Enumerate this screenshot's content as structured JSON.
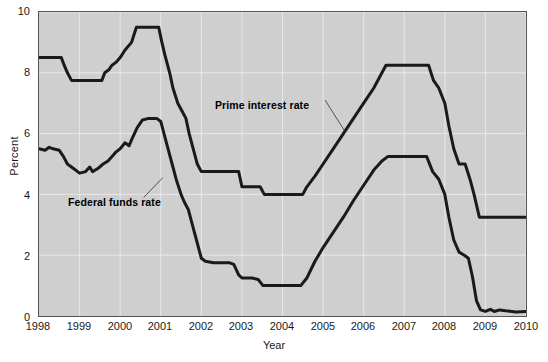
{
  "chart_data": {
    "type": "line",
    "title": "",
    "xlabel": "Year",
    "ylabel": "Percent",
    "xlim": [
      1998,
      2010
    ],
    "ylim": [
      0,
      10
    ],
    "ytick_labels": [
      "0",
      "2",
      "4",
      "6",
      "8",
      "10"
    ],
    "ytick_values": [
      0,
      2,
      4,
      6,
      8,
      10
    ],
    "xtick_labels": [
      "1998",
      "1999",
      "2000",
      "2001",
      "2002",
      "2003",
      "2004",
      "2005",
      "2006",
      "2007",
      "2008",
      "2009",
      "2010"
    ],
    "xtick_values": [
      1998,
      1999,
      2000,
      2001,
      2002,
      2003,
      2004,
      2005,
      2006,
      2007,
      2008,
      2009,
      2010
    ],
    "grid": true,
    "grid_color": "#e8e8e8",
    "plot_background": "#cfcfcf",
    "line_color": "#1a1a1a",
    "legend_position": "inline-annotation",
    "series": [
      {
        "name": "Prime interest rate",
        "annotation": "Prime interest rate",
        "points": [
          [
            1998.0,
            8.5
          ],
          [
            1998.55,
            8.5
          ],
          [
            1998.62,
            8.25
          ],
          [
            1998.7,
            8.0
          ],
          [
            1998.8,
            7.75
          ],
          [
            1999.55,
            7.75
          ],
          [
            1999.62,
            8.0
          ],
          [
            1999.72,
            8.1
          ],
          [
            1999.8,
            8.25
          ],
          [
            1999.9,
            8.35
          ],
          [
            2000.0,
            8.5
          ],
          [
            2000.12,
            8.75
          ],
          [
            2000.28,
            9.0
          ],
          [
            2000.4,
            9.5
          ],
          [
            2000.95,
            9.5
          ],
          [
            2001.02,
            9.05
          ],
          [
            2001.1,
            8.6
          ],
          [
            2001.22,
            8.0
          ],
          [
            2001.3,
            7.5
          ],
          [
            2001.42,
            7.0
          ],
          [
            2001.52,
            6.75
          ],
          [
            2001.62,
            6.5
          ],
          [
            2001.7,
            6.0
          ],
          [
            2001.8,
            5.5
          ],
          [
            2001.9,
            5.0
          ],
          [
            2002.0,
            4.75
          ],
          [
            2002.6,
            4.75
          ],
          [
            2002.92,
            4.75
          ],
          [
            2003.0,
            4.25
          ],
          [
            2003.45,
            4.25
          ],
          [
            2003.55,
            4.0
          ],
          [
            2004.5,
            4.0
          ],
          [
            2004.6,
            4.25
          ],
          [
            2004.8,
            4.6
          ],
          [
            2005.0,
            5.0
          ],
          [
            2005.25,
            5.5
          ],
          [
            2005.5,
            6.0
          ],
          [
            2005.75,
            6.5
          ],
          [
            2006.0,
            7.0
          ],
          [
            2006.25,
            7.5
          ],
          [
            2006.45,
            8.0
          ],
          [
            2006.55,
            8.25
          ],
          [
            2007.6,
            8.25
          ],
          [
            2007.72,
            7.75
          ],
          [
            2007.85,
            7.5
          ],
          [
            2008.0,
            7.0
          ],
          [
            2008.1,
            6.25
          ],
          [
            2008.22,
            5.5
          ],
          [
            2008.35,
            5.0
          ],
          [
            2008.5,
            5.0
          ],
          [
            2008.62,
            4.5
          ],
          [
            2008.72,
            4.0
          ],
          [
            2008.85,
            3.25
          ],
          [
            2009.0,
            3.25
          ],
          [
            2010.0,
            3.25
          ]
        ]
      },
      {
        "name": "Federal funds rate",
        "annotation": "Federal funds rate",
        "points": [
          [
            1998.0,
            5.5
          ],
          [
            1998.15,
            5.45
          ],
          [
            1998.25,
            5.55
          ],
          [
            1998.35,
            5.5
          ],
          [
            1998.5,
            5.45
          ],
          [
            1998.6,
            5.25
          ],
          [
            1998.7,
            5.0
          ],
          [
            1998.85,
            4.85
          ],
          [
            1999.0,
            4.7
          ],
          [
            1999.15,
            4.75
          ],
          [
            1999.25,
            4.9
          ],
          [
            1999.32,
            4.75
          ],
          [
            1999.45,
            4.85
          ],
          [
            1999.58,
            5.0
          ],
          [
            1999.7,
            5.1
          ],
          [
            1999.8,
            5.25
          ],
          [
            1999.9,
            5.4
          ],
          [
            2000.0,
            5.5
          ],
          [
            2000.12,
            5.7
          ],
          [
            2000.22,
            5.6
          ],
          [
            2000.3,
            5.85
          ],
          [
            2000.42,
            6.2
          ],
          [
            2000.55,
            6.45
          ],
          [
            2000.7,
            6.5
          ],
          [
            2000.9,
            6.5
          ],
          [
            2001.0,
            6.4
          ],
          [
            2001.08,
            6.0
          ],
          [
            2001.18,
            5.5
          ],
          [
            2001.28,
            5.0
          ],
          [
            2001.38,
            4.5
          ],
          [
            2001.5,
            4.0
          ],
          [
            2001.58,
            3.75
          ],
          [
            2001.68,
            3.5
          ],
          [
            2001.78,
            3.0
          ],
          [
            2001.88,
            2.5
          ],
          [
            2002.0,
            1.9
          ],
          [
            2002.1,
            1.8
          ],
          [
            2002.3,
            1.75
          ],
          [
            2002.7,
            1.75
          ],
          [
            2002.8,
            1.7
          ],
          [
            2002.92,
            1.35
          ],
          [
            2003.0,
            1.25
          ],
          [
            2003.25,
            1.25
          ],
          [
            2003.4,
            1.2
          ],
          [
            2003.52,
            1.0
          ],
          [
            2004.45,
            1.0
          ],
          [
            2004.6,
            1.25
          ],
          [
            2004.8,
            1.8
          ],
          [
            2005.0,
            2.25
          ],
          [
            2005.25,
            2.75
          ],
          [
            2005.5,
            3.25
          ],
          [
            2005.75,
            3.8
          ],
          [
            2006.0,
            4.3
          ],
          [
            2006.25,
            4.8
          ],
          [
            2006.45,
            5.1
          ],
          [
            2006.6,
            5.25
          ],
          [
            2007.55,
            5.25
          ],
          [
            2007.7,
            4.75
          ],
          [
            2007.85,
            4.5
          ],
          [
            2008.0,
            4.0
          ],
          [
            2008.1,
            3.25
          ],
          [
            2008.22,
            2.5
          ],
          [
            2008.35,
            2.1
          ],
          [
            2008.48,
            2.0
          ],
          [
            2008.58,
            1.9
          ],
          [
            2008.68,
            1.3
          ],
          [
            2008.78,
            0.5
          ],
          [
            2008.88,
            0.2
          ],
          [
            2009.0,
            0.15
          ],
          [
            2009.12,
            0.22
          ],
          [
            2009.22,
            0.15
          ],
          [
            2009.35,
            0.2
          ],
          [
            2009.5,
            0.17
          ],
          [
            2009.75,
            0.13
          ],
          [
            2010.0,
            0.15
          ]
        ]
      }
    ],
    "annotations": [
      {
        "name": "prime-interest-rate-label",
        "text": "Prime interest rate",
        "leader_from": [
          2005.05,
          7.1
        ],
        "leader_to": [
          2005.55,
          6.05
        ]
      },
      {
        "name": "federal-funds-rate-label",
        "text": "Federal funds rate",
        "leader_from": [
          2001.05,
          4.55
        ],
        "leader_to": [
          2000.58,
          3.9
        ]
      }
    ]
  }
}
